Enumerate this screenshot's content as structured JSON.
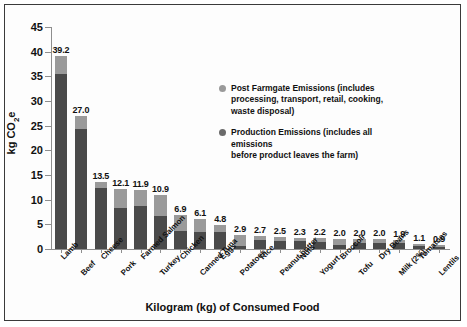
{
  "chart_data": {
    "type": "bar",
    "subtype": "stacked-vertical",
    "title": "",
    "xlabel": "Kilogram (kg) of Consumed Food",
    "ylabel": "kg CO2e",
    "ylabel_html": "kg CO<sub>2</sub>e",
    "ylim": [
      0,
      45
    ],
    "yticks": [
      0,
      5,
      10,
      15,
      20,
      25,
      30,
      35,
      40,
      45
    ],
    "grid": false,
    "legend_position": "inside-upper-right",
    "categories": [
      "Lamb",
      "Beef",
      "Cheese",
      "Pork",
      "Farmed Salmon",
      "Turkey",
      "Chicken",
      "Canned Tuna",
      "Eggs",
      "Potatoes",
      "Rice",
      "Peanut butter",
      "Nuts",
      "Yogurt",
      "Broccoli",
      "Tofu",
      "Dry Beans",
      "Milk (2%)",
      "Tomatoes",
      "Lentils"
    ],
    "totals": [
      39.2,
      27.0,
      13.5,
      12.1,
      11.9,
      10.9,
      6.9,
      6.1,
      4.8,
      2.9,
      2.7,
      2.5,
      2.3,
      2.2,
      2.0,
      2.0,
      2.0,
      1.9,
      1.1,
      0.9
    ],
    "series": [
      {
        "name": "Production Emissions",
        "color": "#4a4a4a",
        "values": [
          35.5,
          24.3,
          12.4,
          8.4,
          8.7,
          6.6,
          3.7,
          3.5,
          3.4,
          0.6,
          1.9,
          1.6,
          1.7,
          1.4,
          0.9,
          1.2,
          1.3,
          1.2,
          0.6,
          0.5
        ]
      },
      {
        "name": "Post Farmgate Emissions",
        "color": "#9a9a9a",
        "values": [
          3.7,
          2.7,
          1.1,
          3.7,
          3.2,
          4.3,
          3.2,
          2.6,
          1.4,
          2.3,
          0.8,
          0.9,
          0.6,
          0.8,
          1.1,
          0.8,
          0.7,
          0.7,
          0.5,
          0.4
        ]
      }
    ],
    "legend": [
      {
        "key": "post-farmgate",
        "color": "#9a9a9a",
        "lines": [
          "Post Farmgate Emissions (includes",
          "processing, transport, retail, cooking,",
          "waste disposal)"
        ]
      },
      {
        "key": "production",
        "color": "#6a6a6a",
        "lines": [
          "Production Emissions (includes all emissions",
          "before product leaves the farm)"
        ]
      }
    ]
  }
}
